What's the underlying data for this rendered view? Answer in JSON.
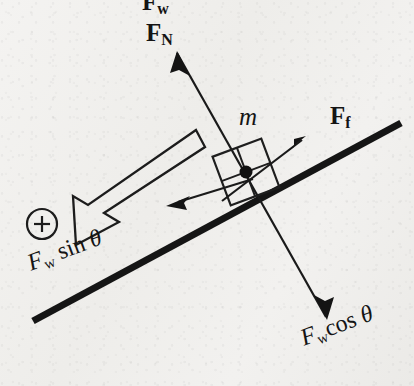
{
  "figure": {
    "kind": "free-body-diagram",
    "background_color": "#f1f0ee",
    "ink_color": "#141414",
    "incline_angle_deg": 20.5
  },
  "labels": {
    "normal_force": {
      "symbol": "F",
      "subscript": "N",
      "style": "bold-vector"
    },
    "friction_force": {
      "symbol": "F",
      "subscript": "f",
      "style": "bold-vector"
    },
    "mass": {
      "symbol": "m",
      "style": "italic-scalar"
    },
    "weight_parallel": {
      "symbol": "F",
      "subscript": "w",
      "factor": "sin",
      "angle": "θ"
    },
    "weight_perpendicular": {
      "symbol": "F",
      "subscript": "w",
      "factor": "cos",
      "angle": "θ"
    },
    "weight_top_cropped": {
      "symbol": "F",
      "subscript": "w"
    },
    "positive_direction": {
      "glyph": "+",
      "meaning": "circled-plus-positive-axis-marker"
    }
  },
  "geometry": {
    "incline": {
      "x1": 33,
      "y1": 321,
      "x2": 401,
      "y2": 123,
      "stroke_width": 7
    },
    "block": {
      "center_x": 246,
      "center_y": 172,
      "half_size": 26,
      "rotation_deg": -20.5,
      "stroke_width": 2
    },
    "center_dot": {
      "cx": 246,
      "cy": 172,
      "r": 6.5
    },
    "arrow_normal": {
      "x1": 246,
      "y1": 172,
      "x2": 177,
      "y2": 53,
      "stroke_width": 2.4
    },
    "arrow_weight_perp": {
      "x1": 246,
      "y1": 172,
      "x2": 326,
      "y2": 317,
      "stroke_width": 2.4
    },
    "arrow_friction": {
      "x1": 231,
      "y1": 195,
      "x2": 305,
      "y2": 138,
      "stroke_width": 2.4
    },
    "arrow_weight_par": {
      "x1": 246,
      "y1": 172,
      "x2": 168,
      "y2": 205,
      "stroke_width": 2.4
    },
    "hollow_arrow": {
      "tail_x": 200,
      "tail_y": 138,
      "tip_x": 62,
      "tip_y": 229,
      "shaft_half_width": 9,
      "head_half_width": 23,
      "head_length": 40,
      "stroke_width": 2.2
    },
    "plus_circle": {
      "cx": 42,
      "cy": 224,
      "r": 15,
      "stroke_width": 2.2
    }
  }
}
